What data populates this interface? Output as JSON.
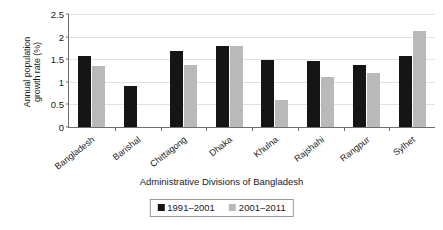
{
  "chart_data": {
    "type": "bar",
    "title": "",
    "xlabel": "Administrative Divisions of Bangladesh",
    "ylabel": "Annual population growth rate (%)",
    "ylabel_lines": [
      "Annual population",
      "growth rate (%)"
    ],
    "categories": [
      "Bangladesh",
      "Barishal",
      "Chittagong",
      "Dhaka",
      "Khulna",
      "Rajshahi",
      "Rangpur",
      "Sylhet"
    ],
    "series": [
      {
        "name": "1991–2001",
        "color": "#151515",
        "values": [
          1.58,
          0.9,
          1.68,
          1.8,
          1.48,
          1.45,
          1.38,
          1.58
        ]
      },
      {
        "name": "2001–2011",
        "color": "#b9b9b9",
        "values": [
          1.35,
          0,
          1.38,
          1.8,
          0.6,
          1.1,
          1.2,
          2.13
        ]
      }
    ],
    "ylim": [
      0,
      2.5
    ],
    "yticks": [
      0,
      0.5,
      1,
      1.5,
      2,
      2.5
    ],
    "ytick_labels": [
      "0",
      "0.5",
      "1",
      "1.5",
      "2",
      "2.5"
    ],
    "grid": true,
    "legend_position": "bottom-center"
  }
}
